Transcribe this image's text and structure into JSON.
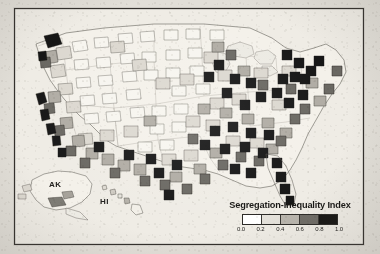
{
  "figure": {
    "type": "choropleth-map",
    "region": "United States (counties / metropolitan areas)",
    "background_color": "#e2dfd8",
    "frame_color": "#33312d",
    "land_fill": "#f4f1ea"
  },
  "insets": [
    {
      "name": "alaska-inset",
      "label": "AK"
    },
    {
      "name": "hawaii-inset",
      "label": "HI"
    }
  ],
  "legend": {
    "title": "Segregation-Inequality Index",
    "tick_labels": [
      "0.0",
      "0.2",
      "0.4",
      "0.6",
      "0.8",
      "1.0"
    ],
    "swatch_colors": [
      "#ffffff",
      "#e4e1da",
      "#b9b5ad",
      "#6f6c66",
      "#171614"
    ],
    "scale_min": "0.0",
    "scale_max": "1.0"
  },
  "chart_data": {
    "type": "heatmap",
    "title": "Segregation-Inequality Index",
    "colorbar_label": "Segregation-Inequality Index",
    "colorbar_ticks": [
      0.0,
      0.2,
      0.4,
      0.6,
      0.8,
      1.0
    ],
    "colorbar_colors": [
      "#ffffff",
      "#e4e1da",
      "#b9b5ad",
      "#6f6c66",
      "#171614"
    ],
    "value_range": [
      0.0,
      1.0
    ],
    "grid": false,
    "legend_position": "bottom-right"
  }
}
